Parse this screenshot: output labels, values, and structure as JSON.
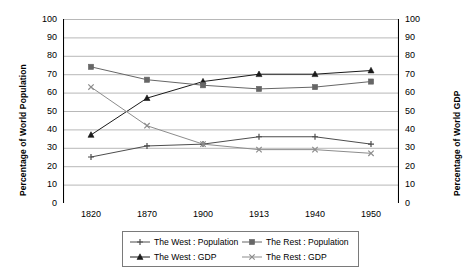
{
  "chart_data": {
    "type": "line",
    "title": "",
    "subtitle": "",
    "xlabel": "",
    "ylabel": "Percentage of World Population",
    "ylabel_right": "Percentage of World GDP",
    "categories": [
      "1820",
      "1870",
      "1900",
      "1913",
      "1940",
      "1950"
    ],
    "ylim": [
      0,
      100
    ],
    "ylim_right": [
      0,
      100
    ],
    "ytick_step": 10,
    "yticks": [
      "0",
      "10",
      "20",
      "30",
      "40",
      "50",
      "60",
      "70",
      "80",
      "90",
      "100"
    ],
    "yticks_right": [
      "0",
      "10",
      "20",
      "30",
      "40",
      "50",
      "60",
      "70",
      "80",
      "90",
      "100"
    ],
    "grid": true,
    "grid_axis": "y",
    "legend_position": "bottom",
    "series": [
      {
        "name": "The West : Population",
        "marker": "plus",
        "color": "#4d4d4d",
        "values": [
          25,
          31,
          32,
          36,
          36,
          32
        ]
      },
      {
        "name": "The West : GDP",
        "marker": "triangle",
        "color": "#1a1a1a",
        "values": [
          37,
          57,
          66,
          70,
          70,
          72
        ]
      },
      {
        "name": "The Rest : Population",
        "marker": "square",
        "color": "#666666",
        "values": [
          74,
          67,
          64,
          62,
          63,
          66
        ]
      },
      {
        "name": "The Rest : GDP",
        "marker": "cross",
        "color": "#8c8c8c",
        "values": [
          63,
          42,
          32,
          29,
          29,
          27
        ]
      }
    ]
  },
  "legend": {
    "entries": [
      {
        "label": "The West : Population"
      },
      {
        "label": "The Rest : Population"
      },
      {
        "label": "The West : GDP"
      },
      {
        "label": "The Rest : GDP"
      }
    ]
  }
}
